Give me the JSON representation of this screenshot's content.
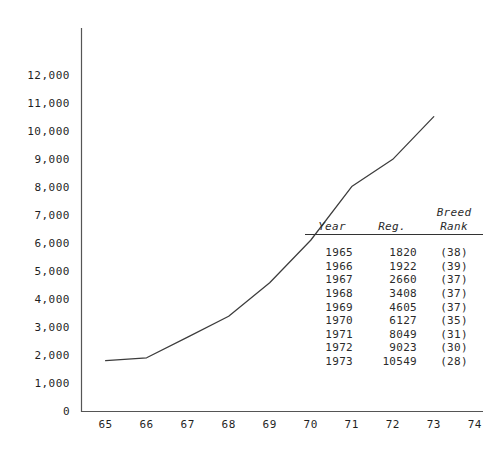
{
  "chart_data": {
    "type": "line",
    "title": "",
    "xlabel": "",
    "ylabel": "",
    "x": [
      1965,
      1966,
      1967,
      1968,
      1969,
      1970,
      1971,
      1972,
      1973
    ],
    "values": [
      1820,
      1922,
      2660,
      3408,
      4605,
      6127,
      8049,
      9023,
      10549
    ],
    "series": [
      {
        "name": "Reg.",
        "values": [
          1820,
          1922,
          2660,
          3408,
          4605,
          6127,
          8049,
          9023,
          10549
        ]
      }
    ],
    "xtick_labels": [
      "65",
      "66",
      "67",
      "68",
      "69",
      "70",
      "71",
      "72",
      "73",
      "74"
    ],
    "xtick_values": [
      1965,
      1966,
      1967,
      1968,
      1969,
      1970,
      1971,
      1972,
      1973,
      1974
    ],
    "ytick_labels": [
      "12,000",
      "11,000",
      "10,000",
      "9,000",
      "8,000",
      "7,000",
      "6,000",
      "5,000",
      "4,000",
      "3,000",
      "2,000",
      "1,000",
      "0"
    ],
    "ytick_values": [
      12000,
      11000,
      10000,
      9000,
      8000,
      7000,
      6000,
      5000,
      4000,
      3000,
      2000,
      1000,
      0
    ],
    "xlim": [
      1964.4,
      1974.2
    ],
    "ylim": [
      0,
      13700
    ],
    "grid": false,
    "legend": "none",
    "line_color": "#3c3c3c",
    "axis_color": "#555555"
  },
  "table": {
    "headers": {
      "year": "Year",
      "reg": "Reg.",
      "rank_top": "Breed",
      "rank": "Rank"
    },
    "rows": [
      {
        "year": "1965",
        "reg": "1820",
        "rank": "(38)"
      },
      {
        "year": "1966",
        "reg": "1922",
        "rank": "(39)"
      },
      {
        "year": "1967",
        "reg": "2660",
        "rank": "(37)"
      },
      {
        "year": "1968",
        "reg": "3408",
        "rank": "(37)"
      },
      {
        "year": "1969",
        "reg": "4605",
        "rank": "(37)"
      },
      {
        "year": "1970",
        "reg": "6127",
        "rank": "(35)"
      },
      {
        "year": "1971",
        "reg": "8049",
        "rank": "(31)"
      },
      {
        "year": "1972",
        "reg": "9023",
        "rank": "(30)"
      },
      {
        "year": "1973",
        "reg": "10549",
        "rank": "(28)"
      }
    ]
  }
}
